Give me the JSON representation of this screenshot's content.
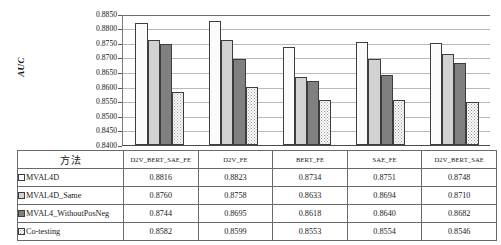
{
  "chart_data": {
    "type": "bar",
    "title": "",
    "xlabel": "",
    "ylabel": "AUC",
    "ylim": [
      0.84,
      0.885
    ],
    "ytick_step": 0.005,
    "grid": true,
    "legend_position": "table-below",
    "categories": [
      "D2V_BERT_SAE_FE",
      "D2V_FE",
      "BERT_FE",
      "SAE_FE",
      "D2V_BERT_SAE"
    ],
    "yticks": [
      "0.8850",
      "0.8800",
      "0.8750",
      "0.8700",
      "0.8650",
      "0.8600",
      "0.8550",
      "0.8500",
      "0.8450",
      "0.8400"
    ],
    "series": [
      {
        "name": "MVAL4D",
        "fill": "white",
        "values": [
          0.8816,
          0.8823,
          0.8734,
          0.8751,
          0.8748
        ],
        "labels": [
          "0.8816",
          "0.8823",
          "0.8734",
          "0.8751",
          "0.8748"
        ]
      },
      {
        "name": "MVAL4D_Same",
        "fill": "lightgray",
        "values": [
          0.876,
          0.8758,
          0.8633,
          0.8694,
          0.871
        ],
        "labels": [
          "0.8760",
          "0.8758",
          "0.8633",
          "0.8694",
          "0.8710"
        ]
      },
      {
        "name": "MVAL4_WithoutPosNeg",
        "fill": "darkgray",
        "values": [
          0.8744,
          0.8695,
          0.8618,
          0.864,
          0.8682
        ],
        "labels": [
          "0.8744",
          "0.8695",
          "0.8618",
          "0.8640",
          "0.8682"
        ]
      },
      {
        "name": "Co-testing",
        "fill": "dotted",
        "values": [
          0.8582,
          0.8599,
          0.8553,
          0.8554,
          0.8546
        ],
        "labels": [
          "0.8582",
          "0.8599",
          "0.8553",
          "0.8554",
          "0.8546"
        ]
      }
    ]
  },
  "table": {
    "method_header": "方法",
    "column_headers": [
      "D2V_BERT_SAE_FE",
      "D2V_FE",
      "BERT_FE",
      "SAE_FE",
      "D2V_BERT_SAE"
    ],
    "rows": [
      {
        "method": "MVAL4D",
        "values": [
          "0.8816",
          "0.8823",
          "0.8734",
          "0.8751",
          "0.8748"
        ]
      },
      {
        "method": "MVAL4D_Same",
        "values": [
          "0.8760",
          "0.8758",
          "0.8633",
          "0.8694",
          "0.8710"
        ]
      },
      {
        "method": "MVAL4_WithoutPosNeg",
        "values": [
          "0.8744",
          "0.8695",
          "0.8618",
          "0.8640",
          "0.8682"
        ]
      },
      {
        "method": "Co-testing",
        "values": [
          "0.8582",
          "0.8599",
          "0.8553",
          "0.8554",
          "0.8546"
        ]
      }
    ]
  },
  "colors": {
    "series_white": "#fbfbfb",
    "series_lightgray": "#d2d2d2",
    "series_darkgray": "#808080",
    "series_dotted": "#fdfdfd",
    "border": "#3d3d3d",
    "gridline": "#b9b9b9",
    "text": "#1a1a1a"
  }
}
